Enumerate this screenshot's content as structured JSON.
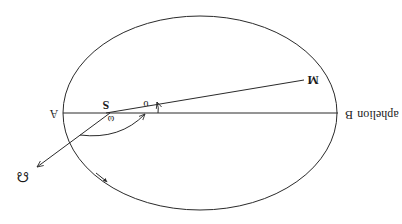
{
  "diagram": {
    "orientation": "rotated 180 degrees",
    "labels": {
      "perihelion_point": "A",
      "aphelion_point": "B",
      "aphelion_text": "aphelion",
      "sun": "S",
      "planet": "M",
      "true_anomaly": "υ",
      "argument_of_perihelion": "ω",
      "ascending_node": "☊"
    },
    "colors": {
      "ink": "#2a2a2a",
      "background": "#ffffff"
    }
  }
}
